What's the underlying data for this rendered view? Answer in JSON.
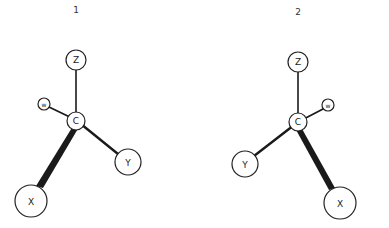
{
  "diagram": {
    "molecules": [
      {
        "label": "1",
        "center": "C",
        "atoms": {
          "Z": "Z",
          "W": "w",
          "C": "C",
          "Y": "Y",
          "X": "X"
        },
        "bonds": [
          {
            "from": "C",
            "to": "Z",
            "style": "normal"
          },
          {
            "from": "C",
            "to": "W",
            "style": "normal"
          },
          {
            "from": "C",
            "to": "Y",
            "style": "bold"
          },
          {
            "from": "C",
            "to": "X",
            "style": "wedge-bold"
          }
        ]
      },
      {
        "label": "2",
        "center": "C",
        "atoms": {
          "Z": "Z",
          "W": "w",
          "C": "C",
          "Y": "Y",
          "X": "X"
        },
        "bonds": [
          {
            "from": "C",
            "to": "Z",
            "style": "normal"
          },
          {
            "from": "C",
            "to": "W",
            "style": "normal"
          },
          {
            "from": "C",
            "to": "Y",
            "style": "bold"
          },
          {
            "from": "C",
            "to": "X",
            "style": "wedge-bold"
          }
        ]
      }
    ],
    "colors": {
      "stroke": "#222222",
      "background": "#ffffff"
    }
  }
}
